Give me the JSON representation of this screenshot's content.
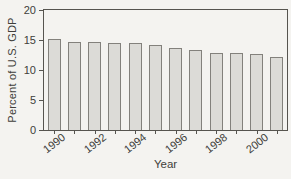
{
  "figure": {
    "background": "#f4f3f0",
    "text_color": "#403e3a",
    "axis_color": "#56544f",
    "bar_fill": "#dcdbd7",
    "bar_border": "#83817c"
  },
  "chart_data": {
    "type": "bar",
    "title": "",
    "xlabel": "Year",
    "ylabel": "Percent of U.S. GDP",
    "categories": [
      "1990",
      "1991",
      "1992",
      "1993",
      "1994",
      "1995",
      "1996",
      "1997",
      "1998",
      "1999",
      "2000",
      "2001"
    ],
    "values": [
      15.1,
      14.7,
      14.7,
      14.5,
      14.5,
      14.1,
      13.7,
      13.3,
      12.9,
      12.8,
      12.6,
      12.2
    ],
    "ylim": [
      0,
      20
    ],
    "yticks": [
      "0",
      "5",
      "10",
      "15",
      "20"
    ],
    "xtick_labels": [
      {
        "text": "1990",
        "bar_index": 0
      },
      {
        "text": "1992",
        "bar_index": 2
      },
      {
        "text": "1994",
        "bar_index": 4
      },
      {
        "text": "1996",
        "bar_index": 6
      },
      {
        "text": "1998",
        "bar_index": 8
      },
      {
        "text": "2000",
        "bar_index": 10
      }
    ],
    "grid": false,
    "legend": null
  }
}
